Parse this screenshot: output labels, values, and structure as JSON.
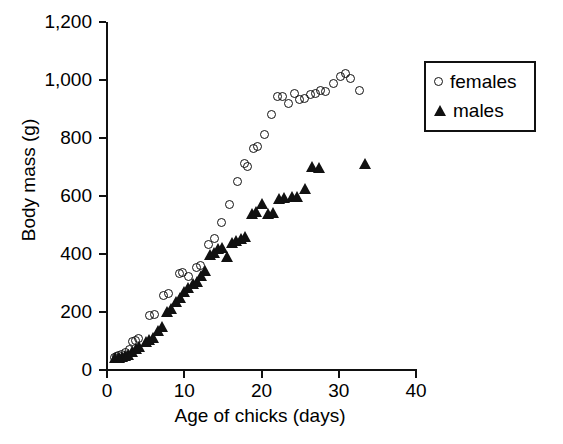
{
  "chart_data": {
    "type": "scatter",
    "title": "",
    "xlabel": "Age of chicks (days)",
    "ylabel": "Body mass (g)",
    "xlim": [
      0,
      40
    ],
    "ylim": [
      0,
      1200
    ],
    "xticks": [
      "0",
      "10",
      "20",
      "30",
      "40"
    ],
    "xtick_values": [
      0,
      10,
      20,
      30,
      40
    ],
    "yticks": [
      "0",
      "200",
      "400",
      "600",
      "800",
      "1,000",
      "1,200"
    ],
    "ytick_values": [
      0,
      200,
      400,
      600,
      800,
      1000,
      1200
    ],
    "grid": false,
    "legend_position": "upper right",
    "series": [
      {
        "name": "females",
        "marker": "open-circle",
        "color": "#111111",
        "points": [
          [
            1.0,
            42
          ],
          [
            1.3,
            45
          ],
          [
            1.6,
            48
          ],
          [
            2.0,
            52
          ],
          [
            2.4,
            58
          ],
          [
            3.0,
            70
          ],
          [
            3.4,
            95
          ],
          [
            3.8,
            100
          ],
          [
            4.2,
            108
          ],
          [
            5.6,
            185
          ],
          [
            6.2,
            190
          ],
          [
            7.4,
            255
          ],
          [
            8.0,
            262
          ],
          [
            9.4,
            330
          ],
          [
            9.9,
            335
          ],
          [
            10.6,
            322
          ],
          [
            11.7,
            352
          ],
          [
            12.2,
            358
          ],
          [
            13.2,
            432
          ],
          [
            14.0,
            452
          ],
          [
            14.9,
            508
          ],
          [
            15.9,
            570
          ],
          [
            16.9,
            648
          ],
          [
            17.8,
            712
          ],
          [
            18.3,
            700
          ],
          [
            19.0,
            762
          ],
          [
            19.6,
            768
          ],
          [
            20.4,
            810
          ],
          [
            21.3,
            880
          ],
          [
            22.2,
            940
          ],
          [
            22.8,
            942
          ],
          [
            23.5,
            918
          ],
          [
            24.4,
            952
          ],
          [
            25.0,
            930
          ],
          [
            25.6,
            935
          ],
          [
            26.4,
            950
          ],
          [
            27.0,
            952
          ],
          [
            27.7,
            962
          ],
          [
            28.3,
            958
          ],
          [
            29.4,
            985
          ],
          [
            30.3,
            1012
          ],
          [
            30.9,
            1020
          ],
          [
            31.6,
            1005
          ],
          [
            32.7,
            962
          ]
        ]
      },
      {
        "name": "males",
        "marker": "filled-triangle",
        "color": "#111111",
        "points": [
          [
            1.1,
            40
          ],
          [
            1.5,
            42
          ],
          [
            1.9,
            45
          ],
          [
            2.3,
            48
          ],
          [
            2.7,
            52
          ],
          [
            3.2,
            62
          ],
          [
            3.7,
            72
          ],
          [
            4.2,
            80
          ],
          [
            5.0,
            98
          ],
          [
            5.5,
            105
          ],
          [
            6.0,
            112
          ],
          [
            6.6,
            135
          ],
          [
            7.1,
            148
          ],
          [
            7.8,
            200
          ],
          [
            8.3,
            212
          ],
          [
            8.9,
            235
          ],
          [
            9.4,
            248
          ],
          [
            10.0,
            268
          ],
          [
            10.5,
            282
          ],
          [
            11.1,
            298
          ],
          [
            11.6,
            305
          ],
          [
            12.2,
            325
          ],
          [
            12.7,
            340
          ],
          [
            13.3,
            398
          ],
          [
            13.8,
            405
          ],
          [
            14.4,
            418
          ],
          [
            14.9,
            420
          ],
          [
            15.5,
            388
          ],
          [
            16.2,
            438
          ],
          [
            16.7,
            445
          ],
          [
            17.3,
            452
          ],
          [
            17.9,
            458
          ],
          [
            18.8,
            538
          ],
          [
            19.3,
            545
          ],
          [
            20.1,
            572
          ],
          [
            20.9,
            538
          ],
          [
            21.5,
            542
          ],
          [
            22.3,
            588
          ],
          [
            22.9,
            592
          ],
          [
            24.0,
            595
          ],
          [
            24.6,
            598
          ],
          [
            25.6,
            625
          ],
          [
            26.6,
            700
          ],
          [
            27.4,
            698
          ],
          [
            33.4,
            712
          ]
        ]
      }
    ]
  }
}
